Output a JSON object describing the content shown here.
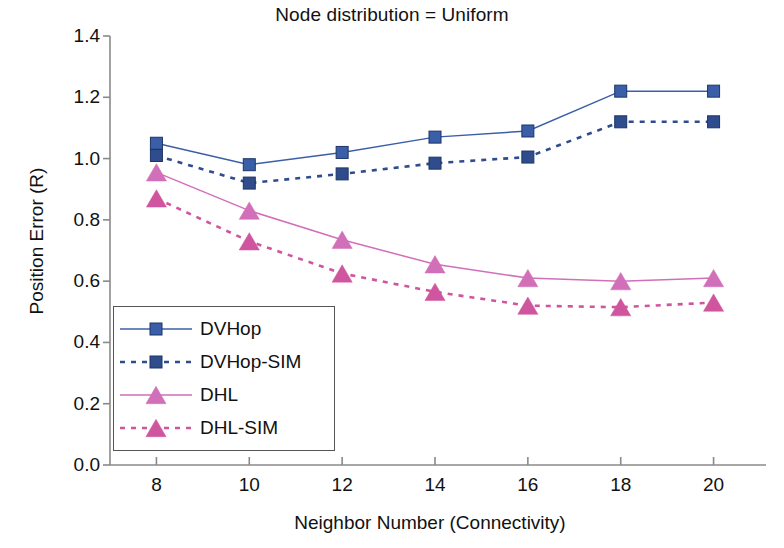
{
  "chart_data": {
    "type": "line",
    "title": "Node distribution = Uniform",
    "xlabel": "Neighbor Number (Connectivity)",
    "ylabel": "Position Error (R)",
    "x": [
      8,
      10,
      12,
      14,
      16,
      18,
      20
    ],
    "xtick_labels": [
      "8",
      "10",
      "12",
      "14",
      "16",
      "18",
      "20"
    ],
    "ytick_labels": [
      "0.0",
      "0.2",
      "0.4",
      "0.6",
      "0.8",
      "1.0",
      "1.2",
      "1.4"
    ],
    "ytick_values": [
      0.0,
      0.2,
      0.4,
      0.6,
      0.8,
      1.0,
      1.2,
      1.4
    ],
    "xlim": [
      7,
      21
    ],
    "ylim": [
      0.0,
      1.4
    ],
    "grid": false,
    "legend_position": "lower-left-inside",
    "series": [
      {
        "name": "DVHop",
        "color": "#3b5ea8",
        "style": "solid",
        "marker": "square",
        "values": [
          1.05,
          0.98,
          1.02,
          1.07,
          1.09,
          1.22,
          1.22
        ]
      },
      {
        "name": "DVHop-SIM",
        "color": "#2f4c8c",
        "style": "dotted",
        "marker": "square",
        "values": [
          1.01,
          0.92,
          0.95,
          0.985,
          1.005,
          1.12,
          1.12
        ]
      },
      {
        "name": "DHL",
        "color": "#d26fb9",
        "style": "solid",
        "marker": "triangle",
        "values": [
          0.955,
          0.83,
          0.735,
          0.655,
          0.61,
          0.6,
          0.61
        ]
      },
      {
        "name": "DHL-SIM",
        "color": "#d0559f",
        "style": "dotted",
        "marker": "triangle",
        "values": [
          0.87,
          0.73,
          0.625,
          0.565,
          0.52,
          0.515,
          0.53
        ]
      }
    ]
  },
  "axis": {
    "color": "#8a8a8a"
  }
}
